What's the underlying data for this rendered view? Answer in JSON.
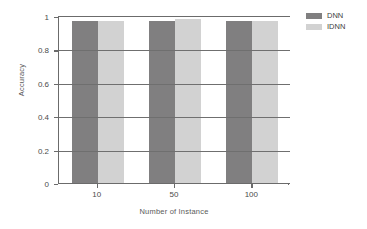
{
  "chart_data": {
    "type": "bar",
    "title": "",
    "xlabel": "Number of Instance",
    "ylabel": "Accuracy",
    "categories": [
      "10",
      "50",
      "100"
    ],
    "series": [
      {
        "name": "DNN",
        "color": "#807f80",
        "values": [
          0.97,
          0.97,
          0.97
        ]
      },
      {
        "name": "IDNN",
        "color": "#d2d2d2",
        "values": [
          0.97,
          0.98,
          0.97
        ]
      }
    ],
    "ylim": [
      0,
      1
    ],
    "yticks": [
      "0",
      "0.2",
      "0.4",
      "0.6",
      "0.8",
      "1"
    ],
    "ytick_values": [
      0,
      0.2,
      0.4,
      0.6,
      0.8,
      1
    ],
    "grid": true,
    "legend_position": "right"
  },
  "legend": {
    "entries": [
      {
        "label": "DNN",
        "color": "#807f80"
      },
      {
        "label": "IDNN",
        "color": "#d2d2d2"
      }
    ]
  },
  "axes": {
    "y_title": "Accuracy",
    "x_title": "Number of Instance"
  },
  "colors": {
    "dnn": "#807f80",
    "idnn": "#d2d2d2",
    "axis": "#6b6b6b",
    "grid": "#6f6f6f",
    "background": "#ffffff"
  }
}
